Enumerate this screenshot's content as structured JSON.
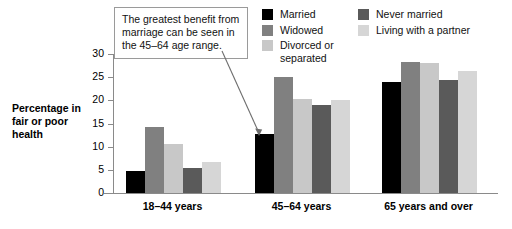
{
  "chart_data": {
    "type": "bar",
    "title": "",
    "xlabel": "",
    "ylabel": "Percentage in fair or poor health",
    "ylim": [
      0,
      30
    ],
    "yticks": [
      0,
      5,
      10,
      15,
      20,
      25,
      30
    ],
    "grid": false,
    "legend_position": "top-right",
    "categories": [
      "18–44 years",
      "45–64 years",
      "65 years and over"
    ],
    "series": [
      {
        "name": "Married",
        "color": "#000000",
        "values": [
          4.8,
          12.8,
          24.0
        ]
      },
      {
        "name": "Widowed",
        "color": "#808080",
        "values": [
          14.2,
          25.0,
          28.2
        ]
      },
      {
        "name": "Divorced or\nseparated",
        "color": "#c8c8c8",
        "values": [
          10.5,
          20.3,
          28.0
        ]
      },
      {
        "name": "Never married",
        "color": "#5a5a5a",
        "values": [
          5.4,
          19.0,
          24.4
        ]
      },
      {
        "name": "Living with a partner",
        "color": "#d6d6d6",
        "values": [
          6.6,
          20.0,
          26.4
        ]
      }
    ],
    "annotations": [
      {
        "text": "The greatest benefit from marriage can be seen in the 45–64 age range.",
        "points_to": "Married bar in 45–64 years group"
      }
    ]
  },
  "legend": {
    "columns": [
      [
        {
          "label": "Married",
          "color": "#000000"
        },
        {
          "label": "Widowed",
          "color": "#808080"
        },
        {
          "label": "Divorced or\nseparated",
          "color": "#c8c8c8"
        }
      ],
      [
        {
          "label": "Never married",
          "color": "#5a5a5a"
        },
        {
          "label": "Living with a partner",
          "color": "#d6d6d6"
        }
      ]
    ]
  },
  "axis": {
    "y_title": "Percentage\nin fair or\npoor health",
    "y_tick_labels": [
      "30",
      "25",
      "20",
      "15",
      "10",
      "5",
      "0"
    ],
    "x_tick_labels": [
      "18–44 years",
      "45–64 years",
      "65 years and over"
    ]
  },
  "annotation": {
    "text": "The greatest benefit from marriage can be seen in the 45–64 age range."
  },
  "colors": {
    "married": "#000000",
    "widowed": "#808080",
    "divorced_or_separated": "#c8c8c8",
    "never_married": "#5a5a5a",
    "living_with_a_partner": "#d6d6d6",
    "axis": "#8a8a8a",
    "background": "#ffffff"
  }
}
